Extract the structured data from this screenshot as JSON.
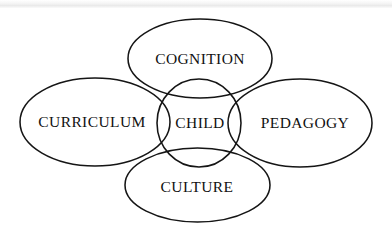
{
  "diagram": {
    "style": {
      "background_color": "#ffffff",
      "stroke_color": "#151515",
      "text_color": "#111111"
    },
    "center_node": {
      "id": "child",
      "label": "CHILD",
      "shape": "circle",
      "cx": 199,
      "cy": 123,
      "rx": 42,
      "ry": 44
    },
    "petal_nodes": [
      {
        "id": "cognition",
        "label": "COGNITION",
        "shape": "ellipse",
        "position": "top",
        "cx": 200,
        "cy": 58.5,
        "rx": 72,
        "ry": 39.5,
        "label_x": 200,
        "label_y": 60
      },
      {
        "id": "curriculum",
        "label": "CURRICULUM",
        "shape": "ellipse",
        "position": "left",
        "cx": 95,
        "cy": 122,
        "rx": 75,
        "ry": 44,
        "label_x": 92,
        "label_y": 123
      },
      {
        "id": "pedagogy",
        "label": "PEDAGOGY",
        "shape": "ellipse",
        "position": "right",
        "cx": 300,
        "cy": 123,
        "rx": 72,
        "ry": 44,
        "label_x": 305,
        "label_y": 124
      },
      {
        "id": "culture",
        "label": "CULTURE",
        "shape": "ellipse",
        "position": "bottom",
        "cx": 197.5,
        "cy": 185,
        "rx": 72.5,
        "ry": 37,
        "label_x": 197,
        "label_y": 188
      }
    ]
  }
}
